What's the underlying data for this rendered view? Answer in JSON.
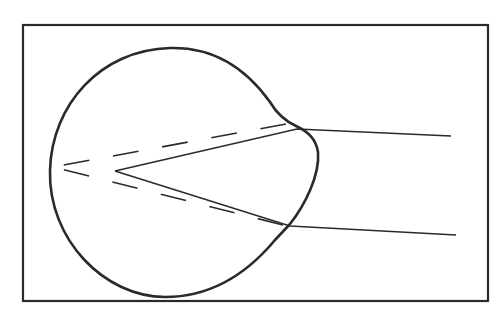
{
  "diagram": {
    "type": "eye-optics-line-drawing",
    "colors": {
      "stroke": "#2a2a2a",
      "background": "#ffffff"
    },
    "frame": {
      "x": 23,
      "y": 25,
      "width": 465,
      "height": 277
    },
    "eyeball": {
      "description": "eye outline with corneal bulge on right"
    },
    "solid_rays": [
      {
        "from": [
          451,
          136
        ],
        "via": [
          297,
          129
        ],
        "to": [
          115,
          171
        ]
      },
      {
        "from": [
          456,
          235
        ],
        "via": [
          290,
          226
        ],
        "to": [
          115,
          171
        ]
      }
    ],
    "dashed_rays": [
      {
        "from": [
          286,
          124
        ],
        "to": [
          53,
          167
        ]
      },
      {
        "from": [
          283,
          225
        ],
        "to": [
          53,
          167
        ]
      }
    ]
  }
}
